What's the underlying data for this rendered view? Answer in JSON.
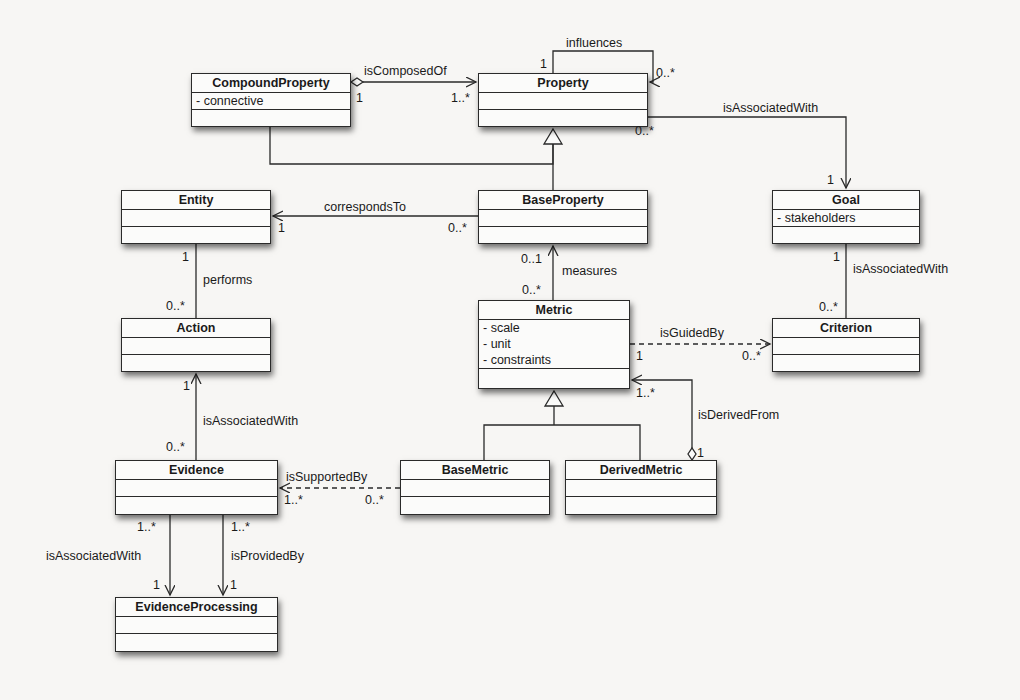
{
  "classes": {
    "compound_property": {
      "name": "CompoundProperty",
      "attributes": [
        "- connective"
      ]
    },
    "property": {
      "name": "Property",
      "attributes": []
    },
    "goal": {
      "name": "Goal",
      "attributes": [
        "- stakeholders"
      ]
    },
    "entity": {
      "name": "Entity",
      "attributes": []
    },
    "base_property": {
      "name": "BaseProperty",
      "attributes": []
    },
    "action": {
      "name": "Action",
      "attributes": []
    },
    "metric": {
      "name": "Metric",
      "attributes": [
        "- scale",
        "- unit",
        "- constraints"
      ]
    },
    "criterion": {
      "name": "Criterion",
      "attributes": []
    },
    "evidence": {
      "name": "Evidence",
      "attributes": []
    },
    "base_metric": {
      "name": "BaseMetric",
      "attributes": []
    },
    "derived_metric": {
      "name": "DerivedMetric",
      "attributes": []
    },
    "evidence_processing": {
      "name": "EvidenceProcessing",
      "attributes": []
    }
  },
  "relations": {
    "is_composed_of": {
      "label": "isComposedOf",
      "source_mult": "1",
      "target_mult": "1..*"
    },
    "influences": {
      "label": "influences",
      "source_mult": "1",
      "target_mult": "0..*"
    },
    "property_goal": {
      "label": "isAssociatedWith",
      "source_mult": "0..*",
      "target_mult": "1"
    },
    "corresponds_to": {
      "label": "correspondsTo",
      "source_mult": "0..*",
      "target_mult": "1"
    },
    "performs": {
      "label": "performs",
      "source_mult": "1",
      "target_mult": "0..*"
    },
    "measures": {
      "label": "measures",
      "source_mult": "0..*",
      "target_mult": "0..1"
    },
    "goal_criterion": {
      "label": "isAssociatedWith",
      "source_mult": "1",
      "target_mult": "0..*"
    },
    "is_guided_by": {
      "label": "isGuidedBy",
      "source_mult": "1",
      "target_mult": "0..*"
    },
    "is_derived_from": {
      "label": "isDerivedFrom",
      "source_mult": "1",
      "target_mult": "1..*"
    },
    "evidence_action": {
      "label": "isAssociatedWith",
      "source_mult": "0..*",
      "target_mult": "1"
    },
    "is_supported_by": {
      "label": "isSupportedBy",
      "source_mult": "0..*",
      "target_mult": "1..*"
    },
    "evidence_processing_assoc": {
      "label": "isAssociatedWith",
      "source_mult": "1..*",
      "target_mult": "1"
    },
    "is_provided_by": {
      "label": "isProvidedBy",
      "source_mult": "1..*",
      "target_mult": "1"
    }
  },
  "colors": {
    "background": "#f7f6f4",
    "line": "#2a2a2a",
    "box_fill": "#fbfbfa"
  }
}
